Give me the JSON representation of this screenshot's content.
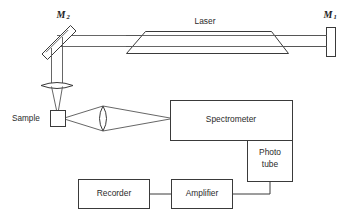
{
  "figure": {
    "background_color": "#ffffff",
    "line_color": "#3a3a3a",
    "text_color": "#2b2b2b"
  },
  "labels": {
    "mirror_left": "M",
    "mirror_left_sub": "2",
    "mirror_right": "M",
    "mirror_right_sub": "1",
    "laser": "Laser",
    "sample": "Sample",
    "spectrometer": "Spectrometer",
    "phototube_line1": "Photo",
    "phototube_line2": "tube",
    "amplifier": "Amplifier",
    "recorder": "Recorder"
  },
  "components": [
    {
      "name": "mirror-m2",
      "label": "M2",
      "shape": "tilted-rectangle",
      "angle_deg": 45
    },
    {
      "name": "mirror-m1",
      "label": "M1",
      "shape": "vertical-rectangle"
    },
    {
      "name": "laser-tube",
      "label": "Laser",
      "shape": "brewster-window-tube"
    },
    {
      "name": "focusing-lens",
      "label": "",
      "shape": "horizontal-lens"
    },
    {
      "name": "sample-cell",
      "label": "Sample",
      "shape": "square"
    },
    {
      "name": "collection-lens",
      "label": "",
      "shape": "vertical-lens"
    },
    {
      "name": "spectrometer",
      "label": "Spectrometer",
      "shape": "rectangle"
    },
    {
      "name": "photo-tube",
      "label": "Photo tube",
      "shape": "rectangle"
    },
    {
      "name": "amplifier",
      "label": "Amplifier",
      "shape": "rectangle"
    },
    {
      "name": "recorder",
      "label": "Recorder",
      "shape": "rectangle"
    }
  ],
  "connections": [
    {
      "from": "mirror-m2",
      "to": "mirror-m1",
      "type": "beam-double-line"
    },
    {
      "from": "mirror-m2",
      "to": "focusing-lens",
      "type": "beam-double-line"
    },
    {
      "from": "focusing-lens",
      "to": "sample-cell",
      "type": "converging-beam"
    },
    {
      "from": "sample-cell",
      "to": "collection-lens",
      "type": "converging-beam"
    },
    {
      "from": "collection-lens",
      "to": "spectrometer",
      "type": "converging-beam"
    },
    {
      "from": "spectrometer",
      "to": "photo-tube",
      "type": "attached"
    },
    {
      "from": "photo-tube",
      "to": "amplifier",
      "type": "wire"
    },
    {
      "from": "amplifier",
      "to": "recorder",
      "type": "wire"
    }
  ]
}
